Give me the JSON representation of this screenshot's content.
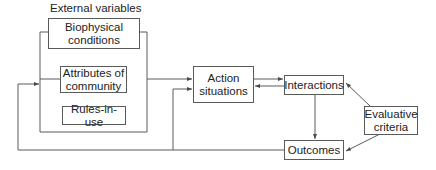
{
  "diagram": {
    "group_label": "External variables",
    "nodes": {
      "biophysical": "Biophysical\nconditions",
      "attributes": "Attributes of\ncommunity",
      "rules": "Rules-in-use",
      "action": "Action\nsituations",
      "interactions": "Interactions",
      "evaluative": "Evaluative\ncriteria",
      "outcomes": "Outcomes"
    },
    "node_lines": {
      "biophysical": [
        "Biophysical",
        "conditions"
      ],
      "attributes": [
        "Attributes of",
        "community"
      ],
      "rules": [
        "Rules-in-use"
      ],
      "action": [
        "Action",
        "situations"
      ],
      "interactions": [
        "Interactions"
      ],
      "evaluative": [
        "Evaluative",
        "criteria"
      ],
      "outcomes": [
        "Outcomes"
      ]
    },
    "edges": [
      {
        "from": "external_variables",
        "to": "action"
      },
      {
        "from": "action",
        "to": "interactions"
      },
      {
        "from": "interactions",
        "to": "action"
      },
      {
        "from": "interactions",
        "to": "outcomes"
      },
      {
        "from": "evaluative",
        "to": "interactions"
      },
      {
        "from": "evaluative",
        "to": "outcomes"
      },
      {
        "from": "outcomes",
        "to": "external_variables"
      },
      {
        "from": "outcomes",
        "to": "action"
      }
    ],
    "colors": {
      "line": "#5a5a5a",
      "text": "#222222",
      "background": "#ffffff"
    }
  }
}
